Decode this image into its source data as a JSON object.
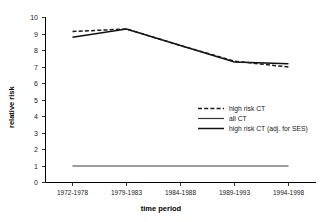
{
  "chart_data": {
    "type": "line",
    "title": "",
    "xlabel": "time period",
    "ylabel": "relative risk",
    "categories": [
      "1972-1978",
      "1979-1983",
      "1984-1988",
      "1989-1993",
      "1994-1998"
    ],
    "ylim": [
      0,
      10
    ],
    "yticks": [
      0,
      1,
      2,
      3,
      4,
      5,
      6,
      7,
      8,
      9,
      10
    ],
    "grid": false,
    "legend_position": "center-right",
    "series": [
      {
        "name": "high risk CT",
        "style": "dashed",
        "color": "#1a1a1a",
        "values": [
          9.15,
          9.3,
          8.3,
          7.35,
          7.0
        ]
      },
      {
        "name": "all CT",
        "style": "solid-thin",
        "color": "#3a3a3a",
        "values": [
          1.0,
          1.0,
          1.0,
          1.0,
          1.0
        ]
      },
      {
        "name": "high risk CT (adj. for SES)",
        "style": "solid-thick",
        "color": "#111111",
        "values": [
          8.8,
          9.3,
          8.3,
          7.3,
          7.2
        ]
      }
    ]
  },
  "axis": {
    "y_title": "relative risk",
    "x_title": "time period",
    "y_tick_labels": [
      "10",
      "9",
      "8",
      "7",
      "6",
      "5",
      "4",
      "3",
      "2",
      "1",
      "0"
    ],
    "x_tick_labels": [
      "1972-1978",
      "1979-1983",
      "1984-1988",
      "1989-1993",
      "1994-1998"
    ]
  },
  "legend": {
    "items": [
      {
        "label": "high risk CT"
      },
      {
        "label": "all CT"
      },
      {
        "label": "high risk CT (adj. for SES)"
      }
    ]
  }
}
